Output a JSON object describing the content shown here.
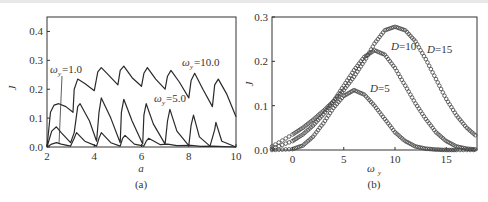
{
  "chart_data": [
    {
      "panel": "(a)",
      "type": "line",
      "xlabel": "a",
      "ylabel": "J",
      "xlim": [
        2,
        10
      ],
      "ylim": [
        0,
        0.45
      ],
      "xticks": [
        "2",
        "4",
        "6",
        "8",
        "10"
      ],
      "yticks": [
        "0.0",
        "0.1",
        "0.2",
        "0.3",
        "0.4"
      ],
      "grid": false,
      "annotations": [
        "ωy=1.0",
        "ωy=5.0",
        "ωy=10.0"
      ],
      "series": [
        {
          "name": "ωy=10.0",
          "x": [
            2.0,
            2.15,
            2.3,
            2.5,
            2.8,
            3.1,
            3.15,
            3.3,
            3.6,
            4.0,
            4.15,
            4.3,
            4.6,
            5.0,
            5.1,
            5.25,
            5.6,
            6.0,
            6.1,
            6.25,
            6.6,
            7.0,
            7.1,
            7.25,
            7.6,
            8.0,
            8.1,
            8.25,
            8.6,
            9.0,
            9.1,
            9.25,
            9.6,
            10.0
          ],
          "values": [
            0.0,
            0.12,
            0.145,
            0.15,
            0.14,
            0.12,
            0.2,
            0.235,
            0.22,
            0.195,
            0.26,
            0.275,
            0.25,
            0.215,
            0.265,
            0.28,
            0.24,
            0.21,
            0.255,
            0.275,
            0.235,
            0.2,
            0.245,
            0.265,
            0.225,
            0.17,
            0.23,
            0.255,
            0.2,
            0.14,
            0.215,
            0.235,
            0.185,
            0.105
          ]
        },
        {
          "name": "ωy=5.0",
          "x": [
            2.0,
            2.2,
            2.4,
            2.6,
            3.0,
            3.15,
            3.3,
            3.4,
            3.8,
            4.1,
            4.2,
            4.3,
            4.7,
            5.1,
            5.15,
            5.25,
            5.6,
            6.05,
            6.1,
            6.2,
            6.5,
            7.0,
            7.1,
            7.2,
            7.5,
            8.0,
            8.1,
            8.2,
            8.45,
            8.9,
            9.1,
            9.15,
            9.4,
            10.0
          ],
          "values": [
            0.0,
            0.055,
            0.07,
            0.05,
            0.015,
            0.05,
            0.14,
            0.15,
            0.09,
            0.02,
            0.12,
            0.17,
            0.1,
            0.015,
            0.12,
            0.165,
            0.09,
            0.01,
            0.11,
            0.15,
            0.08,
            0.01,
            0.09,
            0.13,
            0.055,
            0.005,
            0.075,
            0.11,
            0.035,
            0.003,
            0.06,
            0.085,
            0.02,
            0.0
          ]
        },
        {
          "name": "ωy=1.0",
          "x": [
            2.0,
            2.2,
            2.4,
            2.6,
            3.0,
            3.15,
            3.25,
            3.6,
            4.1,
            4.2,
            4.3,
            4.7,
            5.1,
            5.2,
            5.3,
            5.7,
            6.1,
            6.2,
            6.3,
            6.8,
            7.1,
            7.5,
            8.1,
            8.5,
            9.0,
            10.0
          ],
          "values": [
            0.0,
            0.01,
            0.015,
            0.01,
            0.003,
            0.03,
            0.05,
            0.02,
            0.003,
            0.03,
            0.05,
            0.015,
            0.003,
            0.03,
            0.04,
            0.01,
            0.003,
            0.02,
            0.03,
            0.008,
            0.01,
            0.005,
            0.006,
            0.002,
            0.003,
            0.0
          ]
        }
      ]
    },
    {
      "panel": "(b)",
      "type": "scatter",
      "xlabel": "ωy",
      "ylabel": "J",
      "xlim": [
        -2,
        18
      ],
      "ylim": [
        0,
        0.3
      ],
      "xticks": [
        "0",
        "5",
        "10",
        "15"
      ],
      "yticks": [
        "0.0",
        "0.1",
        "0.2",
        "0.3"
      ],
      "grid": false,
      "annotations": [
        "D=5",
        "D=10",
        "D=15"
      ],
      "series": [
        {
          "name": "D=5",
          "x": [
            -2,
            0,
            1,
            2,
            3,
            4,
            5,
            6,
            7,
            8,
            9,
            10,
            11,
            12,
            13,
            14,
            15,
            16,
            18
          ],
          "values": [
            0.0,
            0.002,
            0.01,
            0.03,
            0.06,
            0.095,
            0.122,
            0.135,
            0.125,
            0.1,
            0.07,
            0.04,
            0.02,
            0.008,
            0.003,
            0.001,
            0.0,
            0.0,
            0.0
          ]
        },
        {
          "name": "D=10",
          "x": [
            -2,
            0,
            1,
            2,
            3,
            4,
            5,
            6,
            7,
            8,
            9,
            10,
            11,
            12,
            13,
            14,
            15,
            16,
            17,
            18
          ],
          "values": [
            0.003,
            0.02,
            0.035,
            0.055,
            0.08,
            0.11,
            0.145,
            0.18,
            0.21,
            0.225,
            0.215,
            0.185,
            0.145,
            0.105,
            0.07,
            0.04,
            0.02,
            0.008,
            0.003,
            0.001
          ]
        },
        {
          "name": "D=15",
          "x": [
            -2,
            0,
            1,
            2,
            3,
            4,
            5,
            6,
            7,
            8,
            9,
            10,
            11,
            12,
            13,
            14,
            15,
            16,
            17,
            18
          ],
          "values": [
            0.008,
            0.035,
            0.05,
            0.068,
            0.088,
            0.11,
            0.135,
            0.165,
            0.2,
            0.24,
            0.27,
            0.278,
            0.27,
            0.245,
            0.205,
            0.16,
            0.115,
            0.078,
            0.05,
            0.03
          ]
        }
      ]
    }
  ],
  "panels": {
    "a": {
      "caption": "(a)",
      "xlabel": "a",
      "ylabel": "J",
      "labels": {
        "w1": "=1.0",
        "w5": "=5.0",
        "w10": "=10.0",
        "omega": "ω",
        "sub": "y"
      }
    },
    "b": {
      "caption": "(b)",
      "xlabel": "ω",
      "xlabel_sub": "y",
      "ylabel": "J",
      "labels": {
        "d5": "=5",
        "d10": "=10",
        "d15": "=15",
        "D": "D"
      }
    }
  }
}
